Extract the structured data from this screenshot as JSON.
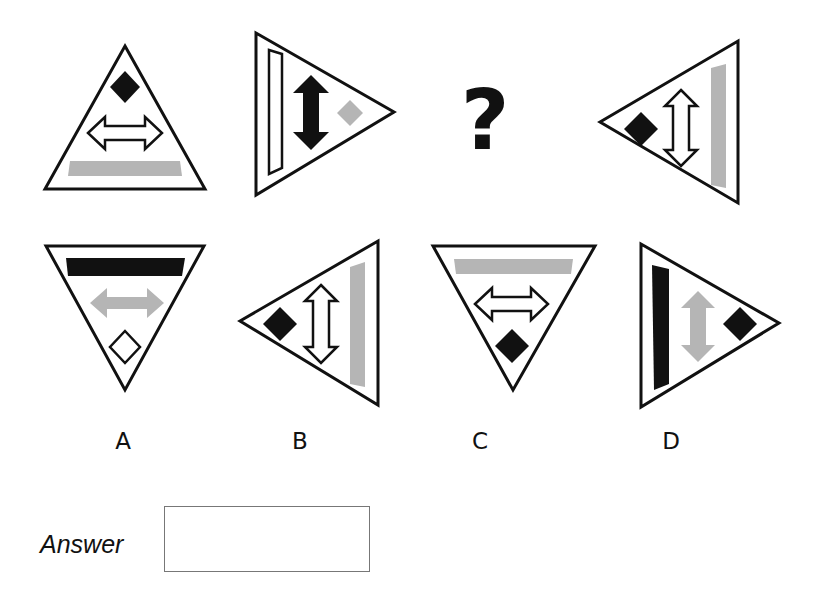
{
  "puzzle": {
    "question_mark": "?",
    "colors": {
      "black": "#111111",
      "grey": "#b5b5b5",
      "white": "#ffffff"
    },
    "sequence": [
      {
        "id": "fig-1",
        "triangle": "pointing-up",
        "elements": [
          "black-diamond",
          "white-horizontal-arrow",
          "grey-bar"
        ]
      },
      {
        "id": "fig-2",
        "triangle": "pointing-right",
        "elements": [
          "white-vertical-bar",
          "black-vertical-arrow",
          "grey-diamond"
        ]
      },
      {
        "id": "fig-3",
        "triangle": "missing"
      },
      {
        "id": "fig-4",
        "triangle": "pointing-left",
        "elements": [
          "black-diamond",
          "white-vertical-arrow",
          "grey-vertical-bar"
        ]
      }
    ],
    "options": [
      {
        "label": "A",
        "triangle": "pointing-down",
        "elements": [
          "black-bar",
          "grey-horizontal-arrow",
          "white-diamond"
        ]
      },
      {
        "label": "B",
        "triangle": "pointing-left",
        "elements": [
          "black-diamond",
          "white-vertical-arrow",
          "grey-vertical-bar"
        ]
      },
      {
        "label": "C",
        "triangle": "pointing-down",
        "elements": [
          "grey-bar",
          "white-horizontal-arrow",
          "black-diamond"
        ]
      },
      {
        "label": "D",
        "triangle": "pointing-right",
        "elements": [
          "black-vertical-bar",
          "grey-vertical-arrow",
          "black-diamond"
        ]
      }
    ]
  },
  "answer": {
    "label": "Answer",
    "value": ""
  }
}
